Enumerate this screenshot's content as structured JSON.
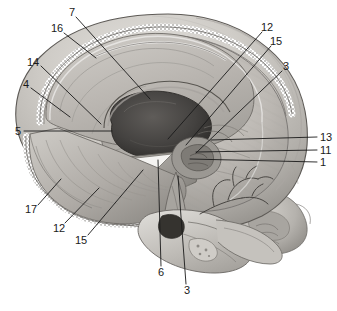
{
  "figure": {
    "medium": "grayscale anatomical line-and-tone illustration",
    "background_color": "#ffffff",
    "ink_color": "#1a1a1a",
    "width": 337,
    "height": 311
  },
  "palette": {
    "background": "#ffffff",
    "outline": "#3a3a3a",
    "leader_line": "#1a1a1a",
    "bone_light": "#d8d6d2",
    "bone_mid": "#bdbab5",
    "bone_shadow": "#97948f",
    "brain_light": "#cfccc7",
    "brain_mid": "#b3afa9",
    "brain_dark": "#8e8a85",
    "ventricle_dark": "#4f4c49",
    "cavity_black": "#2e2c2a",
    "dura_stipple": "#6e6b67",
    "highlight_white": "#f4f3f1"
  },
  "labels": [
    {
      "id": "label-7",
      "text": "7",
      "x": 72,
      "y": 12,
      "anchor": "mid",
      "leader": [
        [
          76,
          17
        ],
        [
          150,
          99
        ]
      ]
    },
    {
      "id": "label-16",
      "text": "16",
      "x": 57,
      "y": 28,
      "anchor": "mid",
      "leader": [
        [
          64,
          33
        ],
        [
          96,
          58
        ]
      ]
    },
    {
      "id": "label-14",
      "text": "14",
      "x": 33,
      "y": 62,
      "anchor": "mid",
      "leader": [
        [
          41,
          66
        ],
        [
          101,
          124
        ]
      ]
    },
    {
      "id": "label-4",
      "text": "4",
      "x": 26,
      "y": 84,
      "anchor": "mid",
      "leader": [
        [
          31,
          88
        ],
        [
          70,
          117
        ]
      ]
    },
    {
      "id": "label-5",
      "text": "5",
      "x": 18,
      "y": 131,
      "anchor": "mid",
      "leader": [
        [
          24,
          131
        ],
        [
          112,
          131
        ]
      ]
    },
    {
      "id": "label-17",
      "text": "17",
      "x": 31,
      "y": 209,
      "anchor": "mid",
      "leader": [
        [
          38,
          205
        ],
        [
          61,
          179
        ]
      ]
    },
    {
      "id": "label-12-left",
      "text": "12",
      "x": 59,
      "y": 228,
      "anchor": "mid",
      "leader": [
        [
          65,
          223
        ],
        [
          99,
          188
        ]
      ]
    },
    {
      "id": "label-15-left",
      "text": "15",
      "x": 81,
      "y": 240,
      "anchor": "mid",
      "leader": [
        [
          88,
          235
        ],
        [
          143,
          170
        ]
      ]
    },
    {
      "id": "label-6",
      "text": "6",
      "x": 161,
      "y": 272,
      "anchor": "mid",
      "leader": [
        [
          161,
          266
        ],
        [
          158,
          160
        ]
      ]
    },
    {
      "id": "label-3-bottom",
      "text": "3",
      "x": 187,
      "y": 290,
      "anchor": "mid",
      "leader": [
        [
          186,
          284
        ],
        [
          178,
          176
        ]
      ]
    },
    {
      "id": "label-12-right",
      "text": "12",
      "x": 267,
      "y": 27,
      "anchor": "mid",
      "leader": [
        [
          262,
          32
        ],
        [
          168,
          139
        ]
      ]
    },
    {
      "id": "label-15-right",
      "text": "15",
      "x": 276,
      "y": 41,
      "anchor": "mid",
      "leader": [
        [
          271,
          46
        ],
        [
          186,
          145
        ]
      ]
    },
    {
      "id": "label-3-right",
      "text": "3",
      "x": 286,
      "y": 66,
      "anchor": "mid",
      "leader": [
        [
          282,
          71
        ],
        [
          196,
          153
        ]
      ]
    },
    {
      "id": "label-13",
      "text": "13",
      "x": 320,
      "y": 137,
      "anchor": "start",
      "leader": [
        [
          317,
          137
        ],
        [
          211,
          140
        ]
      ]
    },
    {
      "id": "label-11",
      "text": "11",
      "x": 320,
      "y": 150,
      "anchor": "start",
      "leader": [
        [
          317,
          150
        ],
        [
          196,
          152
        ]
      ]
    },
    {
      "id": "label-1",
      "text": "1",
      "x": 320,
      "y": 162,
      "anchor": "start",
      "leader": [
        [
          317,
          162
        ],
        [
          190,
          159
        ]
      ]
    }
  ],
  "label_count": 16,
  "distinct_numbers": [
    "1",
    "3",
    "4",
    "5",
    "6",
    "7",
    "11",
    "12",
    "13",
    "14",
    "15",
    "16",
    "17"
  ]
}
